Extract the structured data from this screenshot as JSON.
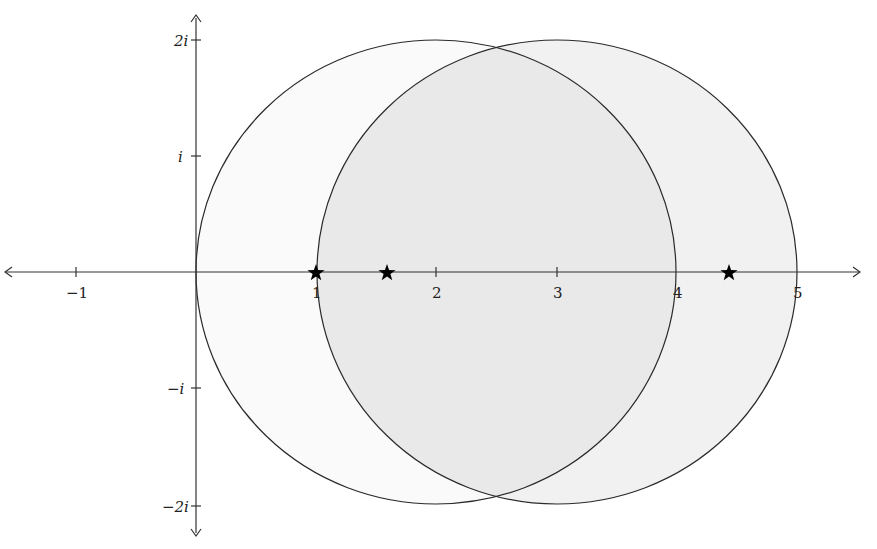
{
  "diagram": {
    "type": "complex-plane",
    "colors": {
      "background": "#ffffff",
      "axis": "#333333",
      "circle_stroke": "#2a2a2a",
      "left_circle_fill": "#fafafa",
      "right_circle_fill": "#f1f1f1",
      "overlap_fill": "#e9e9e9",
      "star": "#000000"
    },
    "real_axis": {
      "ticks": [
        {
          "value": -1,
          "label": "−1"
        },
        {
          "value": 1,
          "label": "1"
        },
        {
          "value": 2,
          "label": "2"
        },
        {
          "value": 3,
          "label": "3"
        },
        {
          "value": 4,
          "label": "4"
        },
        {
          "value": 5,
          "label": "5"
        }
      ]
    },
    "imaginary_axis": {
      "ticks": [
        {
          "value": 2,
          "label": "2i"
        },
        {
          "value": 1,
          "label": "i"
        },
        {
          "value": -1,
          "label": "−i"
        },
        {
          "value": -2,
          "label": "−2i"
        }
      ]
    },
    "circles": [
      {
        "name": "left-circle",
        "center_re": 2,
        "center_im": 0,
        "radius": 2
      },
      {
        "name": "right-circle",
        "center_re": 3,
        "center_im": 0,
        "radius": 2
      }
    ],
    "stars": [
      {
        "re": 1.0,
        "im": 0
      },
      {
        "re": 1.59,
        "im": 0
      },
      {
        "re": 4.44,
        "im": 0
      }
    ]
  },
  "labels": {
    "x_neg1": "−1",
    "x_1": "1",
    "x_2": "2",
    "x_3": "3",
    "x_4": "4",
    "x_5": "5",
    "y_2i": "2i",
    "y_i": "i",
    "y_neg_i": "−i",
    "y_neg_2i": "−2i"
  }
}
